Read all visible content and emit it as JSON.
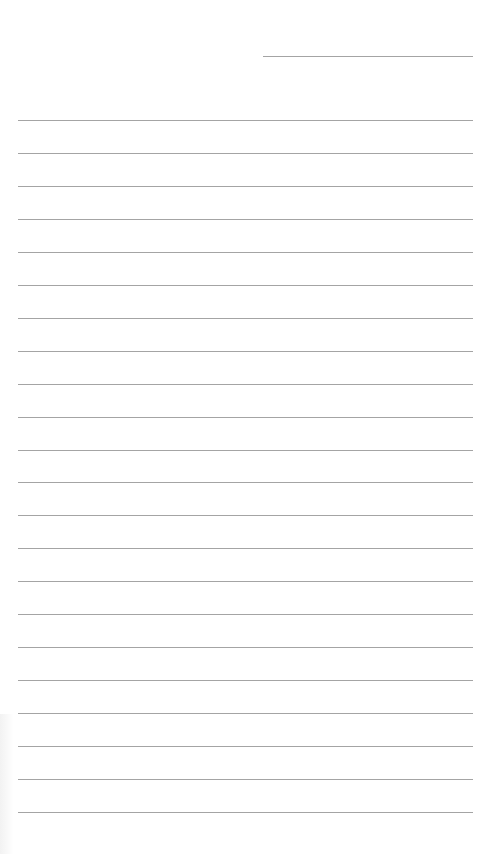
{
  "page": {
    "type": "lined-notepad-page",
    "background_color": "#ffffff",
    "line_color": "#a4a4a4",
    "header_rule": {
      "x": 263,
      "y": 56,
      "width": 210
    },
    "body_rules": {
      "count": 22,
      "first_y": 120,
      "spacing": 32.95,
      "x": 18,
      "width": 455
    },
    "text_content": []
  }
}
